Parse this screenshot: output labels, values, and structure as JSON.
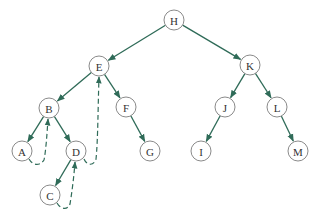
{
  "diagram": {
    "type": "binary-tree",
    "colors": {
      "edge": "#2f6b58",
      "node_stroke": "#8a8a8a",
      "node_fill": "#ffffff",
      "label": "#333333"
    },
    "nodes": [
      {
        "id": "H",
        "label": "H",
        "x": 174,
        "y": 20
      },
      {
        "id": "E",
        "label": "E",
        "x": 99,
        "y": 66
      },
      {
        "id": "K",
        "label": "K",
        "x": 250,
        "y": 65
      },
      {
        "id": "B",
        "label": "B",
        "x": 49,
        "y": 108
      },
      {
        "id": "F",
        "label": "F",
        "x": 126,
        "y": 107
      },
      {
        "id": "J",
        "label": "J",
        "x": 225,
        "y": 107
      },
      {
        "id": "L",
        "label": "L",
        "x": 277,
        "y": 107
      },
      {
        "id": "A",
        "label": "A",
        "x": 22,
        "y": 151
      },
      {
        "id": "D",
        "label": "D",
        "x": 76,
        "y": 151
      },
      {
        "id": "G",
        "label": "G",
        "x": 150,
        "y": 151
      },
      {
        "id": "I",
        "label": "I",
        "x": 201,
        "y": 151
      },
      {
        "id": "M",
        "label": "M",
        "x": 298,
        "y": 151
      },
      {
        "id": "C",
        "label": "C",
        "x": 50,
        "y": 195
      }
    ],
    "edges": [
      {
        "from": "H",
        "to": "E"
      },
      {
        "from": "H",
        "to": "K"
      },
      {
        "from": "E",
        "to": "B"
      },
      {
        "from": "E",
        "to": "F"
      },
      {
        "from": "K",
        "to": "J"
      },
      {
        "from": "K",
        "to": "L"
      },
      {
        "from": "B",
        "to": "A"
      },
      {
        "from": "B",
        "to": "D"
      },
      {
        "from": "F",
        "to": "G"
      },
      {
        "from": "J",
        "to": "I"
      },
      {
        "from": "L",
        "to": "M"
      },
      {
        "from": "D",
        "to": "C"
      }
    ],
    "threads": [
      {
        "from": "A",
        "to": "B",
        "style": "dashed"
      },
      {
        "from": "C",
        "to": "D",
        "style": "dashed"
      },
      {
        "from": "D",
        "to": "E",
        "style": "dashed"
      }
    ]
  }
}
